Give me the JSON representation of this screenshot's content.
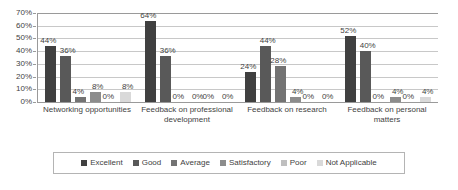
{
  "chart_data": {
    "type": "bar",
    "title": "",
    "subtitle": "",
    "xlabel": "",
    "ylabel": "",
    "ylim": [
      0,
      70
    ],
    "ytick_step": 10,
    "ytick_labels": [
      "0%",
      "10%",
      "20%",
      "30%",
      "40%",
      "50%",
      "60%",
      "70%"
    ],
    "grid": true,
    "legend_position": "bottom",
    "value_suffix": "%",
    "categories": [
      "Networking opportunities",
      "Feedback on professional development",
      "Feedback on research",
      "Feedback on personal matters"
    ],
    "series": [
      {
        "name": "Excellent",
        "color": "#404040",
        "values": [
          44,
          64,
          24,
          52
        ]
      },
      {
        "name": "Good",
        "color": "#595959",
        "values": [
          36,
          36,
          44,
          40
        ]
      },
      {
        "name": "Average",
        "color": "#737373",
        "values": [
          4,
          0,
          28,
          0
        ]
      },
      {
        "name": "Satisfactory",
        "color": "#8c8c8c",
        "values": [
          8,
          0,
          4,
          4
        ]
      },
      {
        "name": "Poor",
        "color": "#bfbfbf",
        "values": [
          0,
          0,
          0,
          0
        ]
      },
      {
        "name": "Not Applicable",
        "color": "#d9d9d9",
        "values": [
          8,
          0,
          0,
          4
        ]
      }
    ],
    "data_labels": [
      [
        "44%",
        "36%",
        "4%",
        "8%",
        "0%",
        "8%"
      ],
      [
        "64%",
        "36%",
        "0%",
        "0%",
        "0%",
        "0%"
      ],
      [
        "24%",
        "44%",
        "28%",
        "4%",
        "0%",
        "0%"
      ],
      [
        "52%",
        "40%",
        "0%",
        "4%",
        "0%",
        "4%"
      ]
    ]
  },
  "axis": {
    "y_ticks": [
      "70%",
      "60%",
      "50%",
      "40%",
      "30%",
      "20%",
      "10%",
      "0%"
    ]
  },
  "legend": {
    "items": [
      {
        "label": "Excellent"
      },
      {
        "label": "Good"
      },
      {
        "label": "Average"
      },
      {
        "label": "Satisfactory"
      },
      {
        "label": "Poor"
      },
      {
        "label": "Not Applicable"
      }
    ]
  },
  "style": {
    "grid_color": "#c8c8c8",
    "axis_color": "#9a9a9a",
    "text_color": "#3f3f3f",
    "background": "#ffffff",
    "legend_border": "#b4b4b4"
  }
}
